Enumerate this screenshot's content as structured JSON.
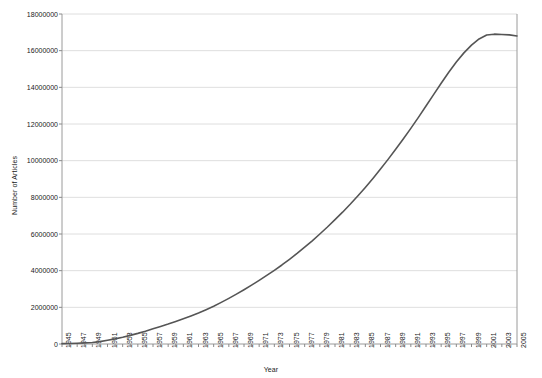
{
  "chart_data": {
    "type": "line",
    "title": "",
    "xlabel": "Year",
    "ylabel": "Number of Articles",
    "grid": true,
    "legend": false,
    "line_color": "#555555",
    "xlim": [
      1945,
      2005
    ],
    "ylim": [
      0,
      18000000
    ],
    "y_ticks": [
      0,
      2000000,
      4000000,
      6000000,
      8000000,
      10000000,
      12000000,
      14000000,
      16000000,
      18000000
    ],
    "y_tick_labels": [
      "0",
      "2000000",
      "4000000",
      "6000000",
      "8000000",
      "10000000",
      "12000000",
      "14000000",
      "16000000",
      "18000000"
    ],
    "x_tick_labels": [
      "1945",
      "1947",
      "1949",
      "1951",
      "1953",
      "1955",
      "1957",
      "1959",
      "1961",
      "1963",
      "1965",
      "1967",
      "1969",
      "1971",
      "1973",
      "1975",
      "1977",
      "1979",
      "1981",
      "1983",
      "1985",
      "1987",
      "1989",
      "1991",
      "1993",
      "1995",
      "1997",
      "1999",
      "2001",
      "2003",
      "2005"
    ],
    "x": [
      1945,
      1946,
      1947,
      1948,
      1949,
      1950,
      1951,
      1952,
      1953,
      1954,
      1955,
      1956,
      1957,
      1958,
      1959,
      1960,
      1961,
      1962,
      1963,
      1964,
      1965,
      1966,
      1967,
      1968,
      1969,
      1970,
      1971,
      1972,
      1973,
      1974,
      1975,
      1976,
      1977,
      1978,
      1979,
      1980,
      1981,
      1982,
      1983,
      1984,
      1985,
      1986,
      1987,
      1988,
      1989,
      1990,
      1991,
      1992,
      1993,
      1994,
      1995,
      1996,
      1997,
      1998,
      1999,
      2000,
      2001,
      2002,
      2003,
      2004,
      2005
    ],
    "values": [
      20000,
      30000,
      45000,
      60000,
      80000,
      130000,
      200000,
      280000,
      370000,
      470000,
      580000,
      700000,
      830000,
      960000,
      1090000,
      1230000,
      1380000,
      1530000,
      1690000,
      1870000,
      2060000,
      2270000,
      2490000,
      2720000,
      2960000,
      3210000,
      3470000,
      3740000,
      4020000,
      4310000,
      4620000,
      4940000,
      5280000,
      5630000,
      6000000,
      6380000,
      6780000,
      7190000,
      7620000,
      8070000,
      8540000,
      9030000,
      9540000,
      10070000,
      10620000,
      11180000,
      11760000,
      12360000,
      12980000,
      13600000,
      14220000,
      14820000,
      15380000,
      15880000,
      16300000,
      16640000,
      16850000,
      16900000,
      16880000,
      16860000,
      16800000
    ]
  }
}
